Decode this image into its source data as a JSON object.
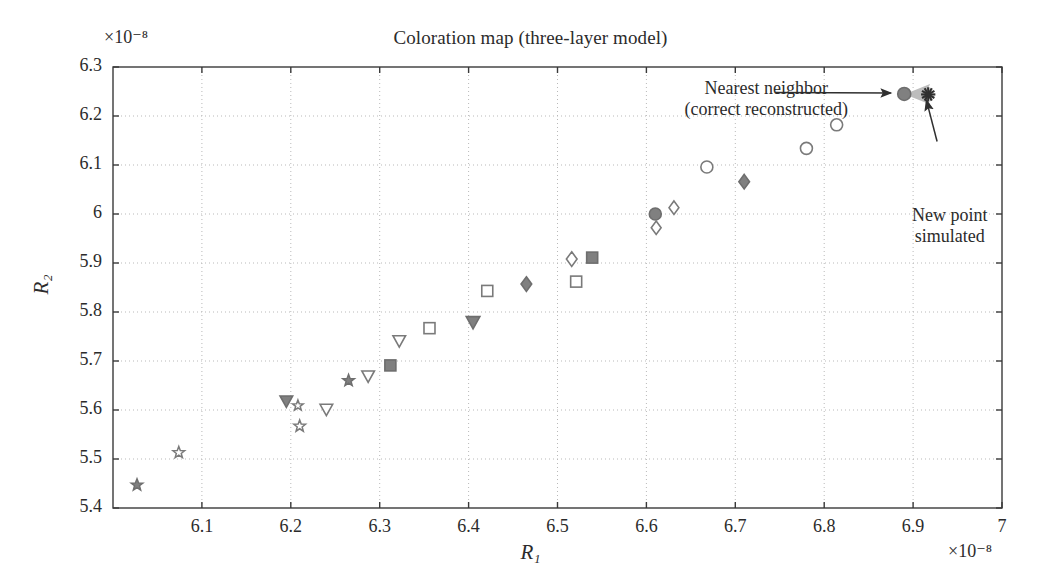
{
  "chart_data": {
    "type": "scatter",
    "title": "Coloration map (three-layer model)",
    "xlabel": "R₁",
    "ylabel": "R₂",
    "x_multiplier": "×10⁻⁸",
    "y_multiplier": "×10⁻⁸",
    "xlim": [
      6.0,
      7.0
    ],
    "ylim": [
      5.4,
      6.3
    ],
    "xticks": [
      "6.1",
      "6.2",
      "6.3",
      "6.4",
      "6.5",
      "6.6",
      "6.7",
      "6.8",
      "6.9",
      "7"
    ],
    "xtick_values": [
      6.1,
      6.2,
      6.3,
      6.4,
      6.5,
      6.6,
      6.7,
      6.8,
      6.9,
      7.0
    ],
    "yticks": [
      "5.4",
      "5.5",
      "5.6",
      "5.7",
      "5.8",
      "5.9",
      "6",
      "6.1",
      "6.2",
      "6.3"
    ],
    "ytick_values": [
      5.4,
      5.5,
      5.6,
      5.7,
      5.8,
      5.9,
      6.0,
      6.1,
      6.2,
      6.3
    ],
    "grid": true,
    "legend": "none",
    "marker_color_filled": "#808080",
    "marker_color_open": "#ffffff",
    "marker_edge_color": "#7a7a7a",
    "grid_color": "#b9b9b9",
    "axis_color": "#3a3a3a",
    "points": [
      {
        "x": 6.027,
        "y": 5.447,
        "marker": "star-filled",
        "size": 11
      },
      {
        "x": 6.074,
        "y": 5.513,
        "marker": "star-open",
        "size": 11
      },
      {
        "x": 6.195,
        "y": 5.617,
        "marker": "triangle-down-filled",
        "size": 12
      },
      {
        "x": 6.208,
        "y": 5.609,
        "marker": "star-open",
        "size": 10
      },
      {
        "x": 6.21,
        "y": 5.567,
        "marker": "star-open",
        "size": 11
      },
      {
        "x": 6.24,
        "y": 5.6,
        "marker": "triangle-down-open",
        "size": 12
      },
      {
        "x": 6.265,
        "y": 5.66,
        "marker": "star-filled",
        "size": 11
      },
      {
        "x": 6.287,
        "y": 5.668,
        "marker": "triangle-down-open",
        "size": 12
      },
      {
        "x": 6.312,
        "y": 5.691,
        "marker": "square-filled",
        "size": 11
      },
      {
        "x": 6.322,
        "y": 5.74,
        "marker": "triangle-down-open",
        "size": 12
      },
      {
        "x": 6.356,
        "y": 5.767,
        "marker": "square-open",
        "size": 11
      },
      {
        "x": 6.405,
        "y": 5.778,
        "marker": "triangle-down-filled",
        "size": 13
      },
      {
        "x": 6.421,
        "y": 5.843,
        "marker": "square-open",
        "size": 11
      },
      {
        "x": 6.465,
        "y": 5.857,
        "marker": "diamond-filled",
        "size": 13
      },
      {
        "x": 6.516,
        "y": 5.908,
        "marker": "diamond-open",
        "size": 13
      },
      {
        "x": 6.521,
        "y": 5.862,
        "marker": "square-open",
        "size": 11
      },
      {
        "x": 6.539,
        "y": 5.911,
        "marker": "square-filled",
        "size": 11
      },
      {
        "x": 6.61,
        "y": 6.0,
        "marker": "circle-filled",
        "size": 12
      },
      {
        "x": 6.611,
        "y": 5.972,
        "marker": "diamond-open",
        "size": 12
      },
      {
        "x": 6.631,
        "y": 6.013,
        "marker": "diamond-open",
        "size": 12
      },
      {
        "x": 6.668,
        "y": 6.096,
        "marker": "circle-open",
        "size": 12
      },
      {
        "x": 6.71,
        "y": 6.066,
        "marker": "diamond-filled",
        "size": 13
      },
      {
        "x": 6.78,
        "y": 6.134,
        "marker": "circle-open",
        "size": 12
      },
      {
        "x": 6.814,
        "y": 6.182,
        "marker": "circle-open",
        "size": 12
      },
      {
        "x": 6.89,
        "y": 6.245,
        "marker": "circle-filled",
        "size": 13
      },
      {
        "x": 6.917,
        "y": 6.244,
        "marker": "asterisk-dark",
        "size": 13
      }
    ],
    "annotations": [
      {
        "id": "nearest-neighbor",
        "lines": [
          "Nearest neighbor",
          "(correct reconstructed)"
        ],
        "arrow_from": [
          6.745,
          6.248
        ],
        "arrow_to": [
          6.875,
          6.247
        ]
      },
      {
        "id": "new-point",
        "lines": [
          "New point",
          "simulated"
        ],
        "arrow_from": [
          6.927,
          6.148
        ],
        "arrow_to": [
          6.915,
          6.232
        ]
      }
    ]
  }
}
